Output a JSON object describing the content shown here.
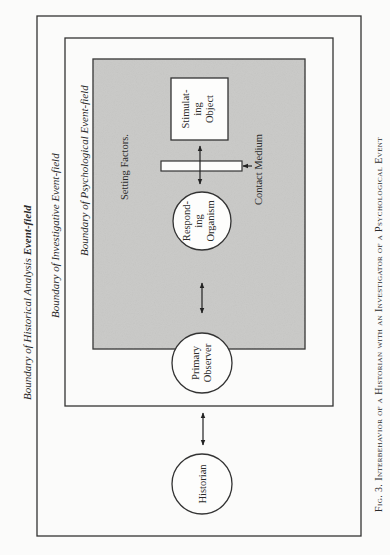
{
  "figure": {
    "caption_prefix": "Fig. 3.",
    "caption": "Interbehavior of a Historian with an Investigator of a Psychological Event",
    "colors": {
      "background": "#fbfbfa",
      "line": "#333333",
      "psych_field_fill": "#c9c9c7",
      "text": "#2a2a2a"
    }
  },
  "boundaries": {
    "historical": {
      "label_prefix": "Boundary of Historical Analysis ",
      "label_emph": "Event-field"
    },
    "investigative": {
      "label": "Boundary of Investigative Event-field"
    },
    "psychological": {
      "label": "Boundary of Psychological Event-field"
    }
  },
  "nodes": {
    "setting_factors": "Setting Factors.",
    "stimulating_object": [
      "Stimulat-",
      "ing",
      "Object"
    ],
    "contact_medium": "Contact Medium",
    "responding_organism": [
      "Respond-",
      "ing",
      "Organism"
    ],
    "primary_observer": [
      "Primary",
      "Observer"
    ],
    "historian": "Historian"
  }
}
